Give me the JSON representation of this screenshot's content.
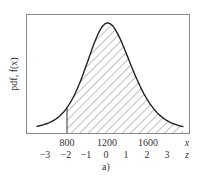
{
  "chart_data": {
    "type": "area",
    "title": "",
    "caption": "a)",
    "ylabel": "pdf, f(x)",
    "xlabel": "x",
    "secondary_xlabel": "z",
    "x_ticks": [
      {
        "value": 800,
        "label": "800"
      },
      {
        "value": 1200,
        "label": "1200"
      },
      {
        "value": 1600,
        "label": "1600"
      }
    ],
    "z_ticks": [
      {
        "value": -3,
        "label": "−3"
      },
      {
        "value": -2,
        "label": "−2"
      },
      {
        "value": -1,
        "label": "−1"
      },
      {
        "value": 0,
        "label": "0"
      },
      {
        "value": 1,
        "label": "1"
      },
      {
        "value": 2,
        "label": "2"
      },
      {
        "value": 3,
        "label": "3"
      }
    ],
    "distribution": {
      "mean": 1200,
      "std": 200,
      "shape": "bell-shaped (normal-like) pdf"
    },
    "shaded_region": {
      "from_x": 800,
      "to_x": "right end",
      "from_z": -2,
      "pattern": "diagonal hatch"
    },
    "x_range": [
      500,
      1950
    ],
    "grid": false,
    "legend": "none"
  },
  "labels": {
    "ylabel": "pdf, f(x)",
    "x_axis_name": "x",
    "z_axis_name": "z",
    "caption": "a)",
    "x_ticks": [
      "800",
      "1200",
      "1600"
    ],
    "z_ticks": [
      "−3",
      "−2",
      "−1",
      "0",
      "1",
      "2",
      "3"
    ]
  }
}
